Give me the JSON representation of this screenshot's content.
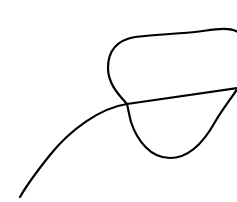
{
  "drawing": {
    "description": "Hand-drawn line sketch: a rounded closed blob with a curved tail extending down-left",
    "stroke_color": "#000000",
    "background_color": "#ffffff",
    "shapes": [
      {
        "name": "blob-outline",
        "type": "closed-curve"
      },
      {
        "name": "tail-curve",
        "type": "open-curve"
      }
    ]
  }
}
